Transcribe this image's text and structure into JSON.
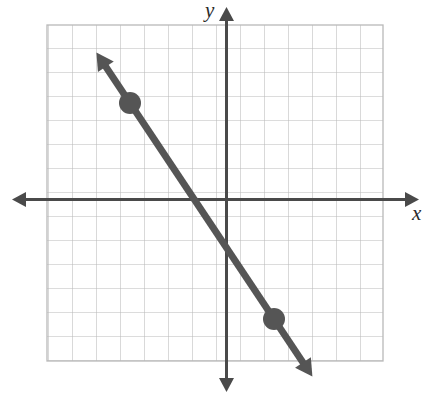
{
  "figure": {
    "background_color": "#ffffff",
    "width": 430,
    "height": 399
  },
  "axes": {
    "x_label": "x",
    "y_label": "y",
    "axis_color": "#4a4a4a",
    "x_axis_label_name": "x-axis-label",
    "y_axis_label_name": "y-axis-label"
  },
  "grid": {
    "color": "#b9b9b9",
    "cell_size_px": 24,
    "columns": 14,
    "rows": 14,
    "visible": true
  },
  "chart_data": {
    "type": "line",
    "title": "",
    "xlabel": "x",
    "ylabel": "y",
    "grid": true,
    "legend": null,
    "xlim": [
      -7.46,
      6.54
    ],
    "ylim": [
      -6.75,
      7.25
    ],
    "xticks": [
      -7,
      -6,
      -5,
      -4,
      -3,
      -2,
      -1,
      0,
      1,
      2,
      3,
      4,
      5,
      6
    ],
    "yticks": [
      -6,
      -5,
      -4,
      -3,
      -2,
      -1,
      0,
      1,
      2,
      3,
      4,
      5,
      6,
      7
    ],
    "tick_labels_shown": false,
    "series": [
      {
        "name": "graphed-line",
        "type": "line",
        "color": "#555555",
        "line_width_px": 7,
        "arrow_start": true,
        "arrow_end": true,
        "slope": -1.5,
        "y_intercept": -2,
        "equation": "y = -1.5x - 2",
        "endpoints_extended": [
          {
            "x": -5.4,
            "y": 6.1
          },
          {
            "x": 3.6,
            "y": -7.4
          }
        ],
        "points": [
          {
            "name": "point-a",
            "x": -4,
            "y": 4,
            "marker": "filled-circle",
            "radius_px": 11,
            "color": "#555555"
          },
          {
            "name": "point-b",
            "x": 2,
            "y": -5,
            "marker": "filled-circle",
            "radius_px": 11,
            "color": "#555555"
          }
        ]
      }
    ]
  },
  "colors": {
    "line": "#555555",
    "point": "#555555",
    "axis": "#4a4a4a",
    "grid": "#b9b9b9",
    "label_text": "#2a2a2a"
  },
  "geometry_px": {
    "origin": {
      "x": 226,
      "y": 199
    },
    "unit_px": 24,
    "grid_rect": {
      "left": 47,
      "top": 25,
      "right": 383,
      "bottom": 361
    },
    "x_axis": {
      "y": 199,
      "from_x": 13,
      "to_x": 418
    },
    "y_axis": {
      "x": 226,
      "from_y": 8,
      "to_y": 391
    },
    "point_a_px": {
      "x": 130,
      "y": 103
    },
    "point_b_px": {
      "x": 274,
      "y": 319
    },
    "line_start_px": {
      "x": 97,
      "y": 62
    },
    "line_end_px": {
      "x": 312,
      "y": 376
    }
  }
}
